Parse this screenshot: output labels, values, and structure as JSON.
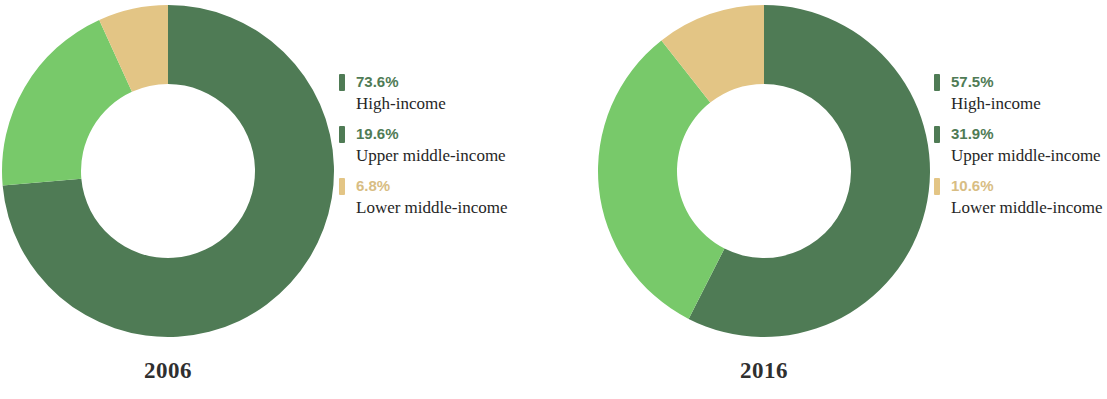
{
  "chart_data": [
    {
      "type": "pie",
      "title": "2006",
      "variant": "donut",
      "categories": [
        "High-income",
        "Upper middle-income",
        "Lower middle-income"
      ],
      "values": [
        73.6,
        19.6,
        6.8
      ],
      "value_labels": [
        "73.6%",
        "19.6%",
        "6.8%"
      ],
      "colors": [
        "#4f7b55",
        "#78c96a",
        "#e3c585"
      ],
      "legend_position": "right",
      "start_angle_deg": 0,
      "direction": "clockwise",
      "inner_radius_ratio": 0.523,
      "units": "percent"
    },
    {
      "type": "pie",
      "title": "2016",
      "variant": "donut",
      "categories": [
        "High-income",
        "Upper middle-income",
        "Lower middle-income"
      ],
      "values": [
        57.5,
        31.9,
        10.6
      ],
      "value_labels": [
        "57.5%",
        "31.9%",
        "10.6%"
      ],
      "colors": [
        "#4f7b55",
        "#78c96a",
        "#e3c585"
      ],
      "legend_position": "right",
      "start_angle_deg": 0,
      "direction": "clockwise",
      "inner_radius_ratio": 0.523,
      "units": "percent"
    }
  ],
  "palette": {
    "high_income": "#4f7b55",
    "upper_middle_income": "#78c96a",
    "lower_middle_income": "#e3c585",
    "legend_green_text": "#4f7b55",
    "legend_tan_text": "#d8bd83",
    "label_text": "#262626",
    "background": "#ffffff"
  },
  "charts": {
    "left": {
      "year": "2006",
      "legend": [
        {
          "pct": "73.6%",
          "name": "High-income",
          "swatch": "#4f7b55",
          "pct_color": "#4f7b55"
        },
        {
          "pct": "19.6%",
          "name": "Upper middle-income",
          "swatch": "#4f7b55",
          "pct_color": "#4f7b55"
        },
        {
          "pct": "6.8%",
          "name": "Lower middle-income",
          "swatch": "#e3c585",
          "pct_color": "#d8bd83"
        }
      ]
    },
    "right": {
      "year": "2016",
      "legend": [
        {
          "pct": "57.5%",
          "name": "High-income",
          "swatch": "#4f7b55",
          "pct_color": "#4f7b55"
        },
        {
          "pct": "31.9%",
          "name": "Upper middle-income",
          "swatch": "#4f7b55",
          "pct_color": "#4f7b55"
        },
        {
          "pct": "10.6%",
          "name": "Lower middle-income",
          "swatch": "#e3c585",
          "pct_color": "#d8bd83"
        }
      ]
    }
  }
}
